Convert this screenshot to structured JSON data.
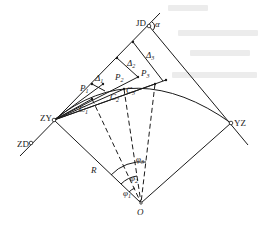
{
  "figure": {
    "type": "circular-curve-deflection-layout",
    "points": {
      "JD": "JD",
      "ZY": "ZY",
      "YZ": "YZ",
      "ZD": "ZD",
      "O": "O"
    },
    "angles": {
      "alpha": "α",
      "phi1": "φ",
      "phi1_sub": "1",
      "phi2": "φ",
      "phi2_sub": "2",
      "phi3": "φ",
      "phi3_sub": "3"
    },
    "offsets": {
      "d1": "Δ",
      "d1_sub": "1",
      "d2": "Δ",
      "d2_sub": "2",
      "d3": "Δ",
      "d3_sub": "3"
    },
    "curve_points": {
      "p1": "P",
      "p1_sub": "1",
      "p2": "P",
      "p2_sub": "2",
      "p3": "P",
      "p3_sub": "3"
    },
    "chords": {
      "c1": "C",
      "c1_sub": "1",
      "c2": "C",
      "c2_sub": "2",
      "c3": "C",
      "c3_sub": "3"
    },
    "radius": "R",
    "colors": {
      "line": "#1a1a1a",
      "background": "#ffffff"
    }
  }
}
